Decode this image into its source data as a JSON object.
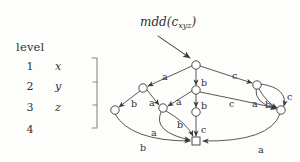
{
  "figure": {
    "title": "mdd(c",
    "title_sub": "xyz",
    "title_close": ")",
    "level_header": "level",
    "levels": [
      {
        "num": "1",
        "var": "x"
      },
      {
        "num": "2",
        "var": "y"
      },
      {
        "num": "3",
        "var": "z"
      },
      {
        "num": "4",
        "var": ""
      }
    ],
    "colors": {
      "stroke": "#3a3a38",
      "text": "#30302e",
      "background": "#fdfdfc",
      "node_fill": "#ffffff"
    }
  },
  "graph": {
    "type": "multi-valued-decision-diagram",
    "nodes": [
      {
        "id": "root",
        "level": 1,
        "cx": 196,
        "cy": 65,
        "shape": "circle",
        "r": 4.2
      },
      {
        "id": "n-a1",
        "level": 2,
        "cx": 143,
        "cy": 88,
        "shape": "circle",
        "r": 4.2
      },
      {
        "id": "n-b1",
        "level": 2,
        "cx": 196,
        "cy": 90,
        "shape": "circle",
        "r": 4.2
      },
      {
        "id": "n-c1",
        "level": 2,
        "cx": 257,
        "cy": 85,
        "shape": "circle",
        "r": 4.2
      },
      {
        "id": "n-a2",
        "level": 3,
        "cx": 115,
        "cy": 110,
        "shape": "circle",
        "r": 4.2
      },
      {
        "id": "n-b2",
        "level": 3,
        "cx": 163,
        "cy": 108,
        "shape": "circle",
        "r": 4.2
      },
      {
        "id": "n-c2",
        "level": 3,
        "cx": 196,
        "cy": 112,
        "shape": "circle",
        "r": 4.2
      },
      {
        "id": "n-d2",
        "level": 3,
        "cx": 281,
        "cy": 110,
        "shape": "circle",
        "r": 4.2
      },
      {
        "id": "terminal",
        "level": 4,
        "cx": 196,
        "cy": 141,
        "shape": "square",
        "w": 8,
        "h": 8
      }
    ],
    "edges": [
      {
        "from": "root",
        "to": "n-a1",
        "label": "a",
        "lx": 162,
        "ly": 72
      },
      {
        "from": "root",
        "to": "n-b1",
        "label": "b",
        "lx": 201,
        "ly": 78
      },
      {
        "from": "root",
        "to": "n-c1",
        "label": "c",
        "lx": 232,
        "ly": 71
      },
      {
        "from": "n-a1",
        "to": "n-a2",
        "label": "b",
        "lx": 131,
        "ly": 99
      },
      {
        "from": "n-a1",
        "to": "n-b2",
        "label": "a",
        "lx": 149,
        "ly": 98
      },
      {
        "from": "n-b1",
        "to": "n-b2",
        "label": "a",
        "lx": 176,
        "ly": 97
      },
      {
        "from": "n-b1",
        "to": "n-c2",
        "label": "b",
        "lx": 201,
        "ly": 101
      },
      {
        "from": "n-b1",
        "to": "n-d2",
        "label": "c",
        "lx": 229,
        "ly": 99
      },
      {
        "from": "n-c1",
        "to": "n-d2",
        "label": "a",
        "lx": 252,
        "ly": 99
      },
      {
        "from": "n-c1",
        "to": "n-d2",
        "label": "b",
        "lx": 265,
        "ly": 100
      },
      {
        "from": "n-c1",
        "to": "n-d2",
        "label": "c",
        "lx": 287,
        "ly": 92
      },
      {
        "from": "n-a2",
        "to": "terminal",
        "label": "b",
        "lx": 140,
        "ly": 143
      },
      {
        "from": "n-b2",
        "to": "terminal",
        "label": "a",
        "lx": 151,
        "ly": 128
      },
      {
        "from": "n-b2",
        "to": "terminal",
        "label": "b",
        "lx": 177,
        "ly": 120
      },
      {
        "from": "n-c2",
        "to": "terminal",
        "label": "c",
        "lx": 201,
        "ly": 125
      },
      {
        "from": "n-d2",
        "to": "terminal",
        "label": "a",
        "lx": 258,
        "ly": 145
      }
    ]
  }
}
